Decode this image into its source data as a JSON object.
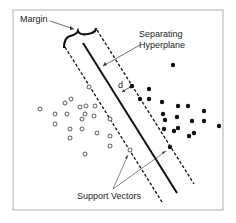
{
  "diagram": {
    "labels": {
      "margin": "Margin",
      "hyperplane_line1": "Separating",
      "hyperplane_line2": "Hyperplane",
      "distance": "d",
      "support_vectors": "Support Vectors"
    },
    "colors": {
      "frame": "#b0b0b0",
      "line": "#111111",
      "text": "#222222"
    },
    "class_open": [
      [
        40,
        109
      ],
      [
        55,
        114
      ],
      [
        67,
        114
      ],
      [
        65,
        103
      ],
      [
        71,
        99
      ],
      [
        80,
        107
      ],
      [
        86,
        106
      ],
      [
        95,
        106
      ],
      [
        82,
        119
      ],
      [
        85,
        114
      ],
      [
        94,
        116
      ],
      [
        55,
        124
      ],
      [
        70,
        129
      ],
      [
        82,
        129
      ],
      [
        70,
        138
      ],
      [
        97,
        133
      ],
      [
        110,
        119
      ],
      [
        110,
        136
      ],
      [
        110,
        146
      ],
      [
        85,
        154
      ],
      [
        89,
        87
      ],
      [
        130,
        150
      ]
    ],
    "class_filled": [
      [
        173,
        65
      ],
      [
        132,
        86
      ],
      [
        149,
        89
      ],
      [
        149,
        99
      ],
      [
        140,
        99
      ],
      [
        162,
        102
      ],
      [
        178,
        106
      ],
      [
        188,
        106
      ],
      [
        163,
        114
      ],
      [
        165,
        120
      ],
      [
        177,
        117
      ],
      [
        192,
        121
      ],
      [
        204,
        111
      ],
      [
        204,
        121
      ],
      [
        219,
        126
      ],
      [
        164,
        129
      ],
      [
        174,
        131
      ],
      [
        178,
        128
      ],
      [
        189,
        136
      ],
      [
        194,
        133
      ],
      [
        170,
        147
      ]
    ]
  }
}
